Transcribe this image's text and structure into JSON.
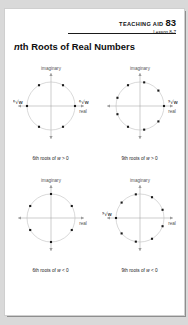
{
  "header": {
    "aid_label": "TEACHING AID",
    "aid_number": "83",
    "lesson": "Lesson 8-7"
  },
  "title": {
    "italic_part": "n",
    "rest": "th Roots of Real Numbers"
  },
  "axis_labels": {
    "imaginary": "imaginary",
    "real": "real"
  },
  "diagrams": [
    {
      "id": "sixth-roots-positive",
      "caption_prefix": "6th roots of ",
      "caption_var": "w",
      "caption_suffix": " > 0",
      "n": 6,
      "start_angle_deg": 0,
      "imaginary_label": "imaginary",
      "real_label": "real",
      "root_labels": [
        {
          "text": "⁶√w",
          "at_angle_deg": 0,
          "side": "right"
        },
        {
          "text": "-⁶√w",
          "at_angle_deg": 180,
          "side": "left"
        }
      ]
    },
    {
      "id": "ninth-roots-positive",
      "caption_prefix": "9th roots of ",
      "caption_var": "w",
      "caption_suffix": " > 0",
      "n": 9,
      "start_angle_deg": 0,
      "imaginary_label": "imaginary",
      "real_label": "real",
      "root_labels": [
        {
          "text": "⁹√w",
          "at_angle_deg": 0,
          "side": "right"
        }
      ]
    },
    {
      "id": "sixth-roots-negative",
      "caption_prefix": "6th roots of ",
      "caption_var": "w",
      "caption_suffix": " < 0",
      "n": 6,
      "start_angle_deg": 30,
      "imaginary_label": "imaginary",
      "real_label": "real",
      "root_labels": []
    },
    {
      "id": "ninth-roots-negative",
      "caption_prefix": "9th roots of ",
      "caption_var": "w",
      "caption_suffix": " < 0",
      "n": 9,
      "start_angle_deg": 20,
      "imaginary_label": "imaginary",
      "real_label": "real",
      "root_labels": [
        {
          "text": "⁹√w",
          "at_angle_deg": 180,
          "side": "left"
        }
      ]
    }
  ],
  "colors": {
    "page": "#ffffff",
    "backdrop": "#d9d9d9",
    "ink": "#111111",
    "circle": "#b9b9b9",
    "axis": "#9a9a9a",
    "point": "#1a1a1a"
  }
}
